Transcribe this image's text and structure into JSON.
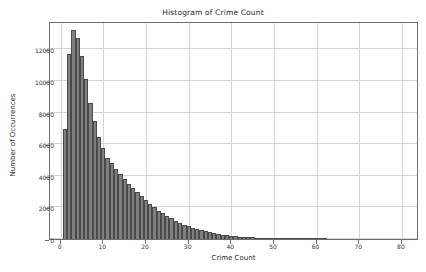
{
  "chart_data": {
    "type": "bar",
    "title": "Histogram of Crime Count",
    "xlabel": "Crime Count",
    "ylabel": "Number of Occurrences",
    "xlim": [
      -2.5,
      84
    ],
    "ylim": [
      0,
      13800
    ],
    "grid": true,
    "legend": null,
    "bin_width": 1,
    "bar_color": "#808080",
    "bar_edge_color": "#4a4a4a",
    "xticks": [
      0,
      10,
      20,
      30,
      40,
      50,
      60,
      70,
      80
    ],
    "xtick_labels": [
      "0",
      "10",
      "20",
      "30",
      "40",
      "50",
      "60",
      "70",
      "80"
    ],
    "yticks": [
      0,
      2000,
      4000,
      6000,
      8000,
      10000,
      12000
    ],
    "ytick_labels": [
      "0",
      "2000",
      "4000",
      "6000",
      "8000",
      "10000",
      "12000"
    ],
    "categories": [
      1,
      2,
      3,
      4,
      5,
      6,
      7,
      8,
      9,
      10,
      11,
      12,
      13,
      14,
      15,
      16,
      17,
      18,
      19,
      20,
      21,
      22,
      23,
      24,
      25,
      26,
      27,
      28,
      29,
      30,
      31,
      32,
      33,
      34,
      35,
      36,
      37,
      38,
      39,
      40,
      41,
      42,
      43,
      44,
      45,
      46,
      47,
      48,
      49,
      50,
      51,
      52,
      53,
      54,
      55,
      56,
      57,
      58,
      59,
      60,
      61,
      62
    ],
    "values": [
      6950,
      11700,
      13200,
      12750,
      11600,
      10100,
      8600,
      7500,
      6450,
      5750,
      5150,
      4800,
      4450,
      4100,
      3800,
      3500,
      3250,
      2950,
      2700,
      2450,
      2200,
      2000,
      1800,
      1620,
      1450,
      1300,
      1150,
      1020,
      900,
      800,
      700,
      620,
      545,
      480,
      420,
      370,
      320,
      280,
      245,
      210,
      180,
      155,
      135,
      115,
      98,
      84,
      72,
      62,
      53,
      45,
      38,
      32,
      27,
      23,
      19,
      16,
      13,
      11,
      9,
      7,
      5,
      3
    ]
  }
}
